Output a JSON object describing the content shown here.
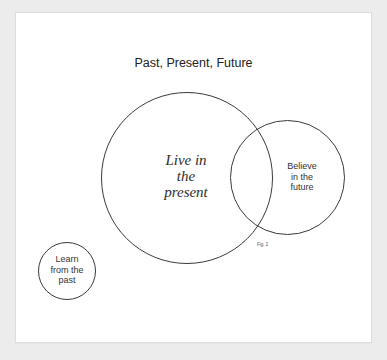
{
  "diagram": {
    "title": "Past, Present, Future",
    "figure_label": "Fig. 2",
    "circles": [
      {
        "id": "present",
        "label": "Live in\nthe\npresent",
        "style": "serif-italic"
      },
      {
        "id": "future",
        "label": "Believe\nin the\nfuture",
        "style": "sans"
      },
      {
        "id": "past",
        "label": "Learn\nfrom the\npast",
        "style": "sans"
      }
    ],
    "colors": {
      "background": "#ececec",
      "card": "#ffffff",
      "stroke": "#3a3a3a",
      "text": "#222222"
    }
  }
}
